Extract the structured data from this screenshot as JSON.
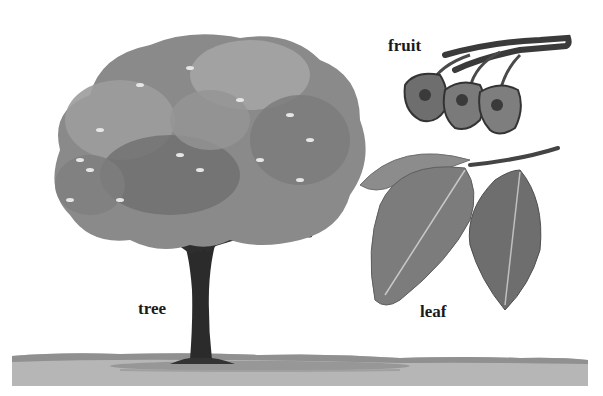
{
  "illustration": {
    "labels": {
      "tree": "tree",
      "fruit": "fruit",
      "leaf": "leaf"
    },
    "colors": {
      "background": "#ffffff",
      "ground": "#b4b4b4",
      "ground_edge": "#8e8e8e",
      "trunk": "#2a2a2a",
      "canopy_dark": "#6a6a6a",
      "canopy_mid": "#8c8c8c",
      "canopy_light": "#a8a8a8",
      "leaf_dark": "#6e6e6e",
      "leaf_mid": "#8a8a8a",
      "fruit_dark": "#3a3a3a",
      "fruit_light": "#9a9a9a",
      "text": "#1a1a1a"
    }
  }
}
